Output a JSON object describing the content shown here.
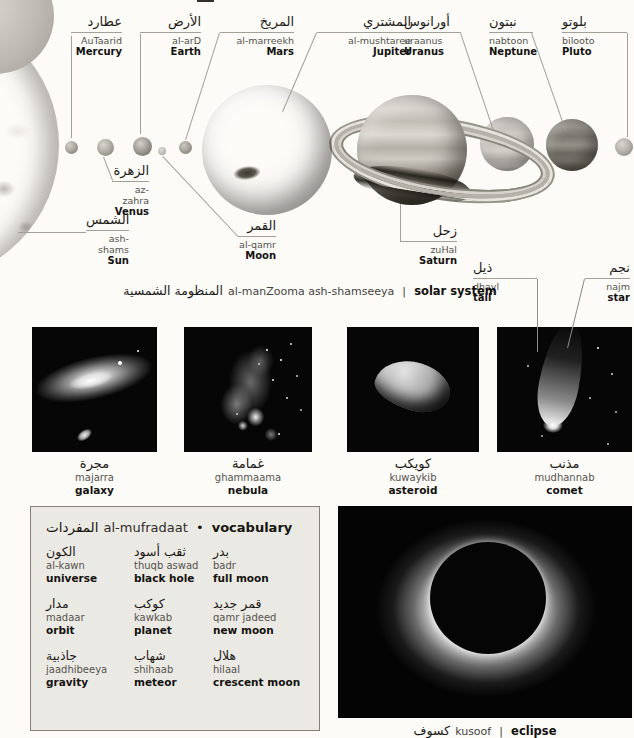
{
  "captions": {
    "solar_system": {
      "arabic": "المنظومة الشمسية",
      "translit": "al-manZooma ash-shamseeya",
      "separator": "|",
      "english": "solar system"
    },
    "eclipse": {
      "arabic": "كسوف",
      "translit": "kusoof",
      "separator": "|",
      "english": "eclipse"
    }
  },
  "planet_labels": [
    {
      "id": "mercury",
      "arabic": "عطارد",
      "translit": "AuTaarid",
      "english": "Mercury"
    },
    {
      "id": "earth",
      "arabic": "الأرض",
      "translit": "al-arD",
      "english": "Earth"
    },
    {
      "id": "mars",
      "arabic": "المريخ",
      "translit": "al-marreekh",
      "english": "Mars"
    },
    {
      "id": "jupiter",
      "arabic": "المشتري",
      "translit": "al-mushtaree",
      "english": "Jupiter"
    },
    {
      "id": "uranus",
      "arabic": "أورانوس",
      "translit": "uraanus",
      "english": "Uranus"
    },
    {
      "id": "neptune",
      "arabic": "نبتون",
      "translit": "nabtoon",
      "english": "Neptune"
    },
    {
      "id": "pluto",
      "arabic": "بلوتو",
      "translit": "bilooto",
      "english": "Pluto"
    },
    {
      "id": "venus",
      "arabic": "الزهرة",
      "translit": "az-zahra",
      "english": "Venus"
    },
    {
      "id": "sun",
      "arabic": "الشمس",
      "translit": "ash-shams",
      "english": "Sun"
    },
    {
      "id": "moon",
      "arabic": "القمر",
      "translit": "al-qamr",
      "english": "Moon"
    },
    {
      "id": "saturn",
      "arabic": "زحل",
      "translit": "zuHal",
      "english": "Saturn"
    },
    {
      "id": "tail",
      "arabic": "ذيل",
      "translit": "dhayl",
      "english": "tail"
    },
    {
      "id": "star",
      "arabic": "نجم",
      "translit": "najm",
      "english": "star"
    }
  ],
  "photos": [
    {
      "id": "galaxy",
      "arabic": "مجرة",
      "translit": "majarra",
      "english": "galaxy"
    },
    {
      "id": "nebula",
      "arabic": "غمامة",
      "translit": "ghammaama",
      "english": "nebula"
    },
    {
      "id": "asteroid",
      "arabic": "كويكب",
      "translit": "kuwaykib",
      "english": "asteroid"
    },
    {
      "id": "comet",
      "arabic": "مذنب",
      "translit": "mudhannab",
      "english": "comet"
    }
  ],
  "vocabulary": {
    "title": {
      "arabic": "المفردات",
      "translit": "al-mufradaat",
      "bullet": "•",
      "english": "vocabulary"
    },
    "entries": [
      {
        "arabic": "الكون",
        "translit": "al-kawn",
        "english": "universe"
      },
      {
        "arabic": "ثقب أسود",
        "translit": "thuqb aswad",
        "english": "black hole"
      },
      {
        "arabic": "بدر",
        "translit": "badr",
        "english": "full moon"
      },
      {
        "arabic": "مدار",
        "translit": "madaar",
        "english": "orbit"
      },
      {
        "arabic": "كوكب",
        "translit": "kawkab",
        "english": "planet"
      },
      {
        "arabic": "قمر جديد",
        "translit": "qamr jadeed",
        "english": "new moon"
      },
      {
        "arabic": "جاذبية",
        "translit": "jaadhibeeya",
        "english": "gravity"
      },
      {
        "arabic": "شهاب",
        "translit": "shihaab",
        "english": "meteor"
      },
      {
        "arabic": "هلال",
        "translit": "hilaal",
        "english": "crescent moon"
      }
    ]
  },
  "colors": {
    "photo_bg": "#060606",
    "box_bg": "#ebe9e4",
    "box_border": "#84817c",
    "leader_line": "#a39f99",
    "translit_text": "#55524d",
    "text": "#14120f"
  }
}
